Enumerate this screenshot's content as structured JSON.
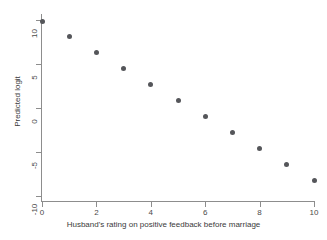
{
  "chart_data": {
    "type": "scatter",
    "title": "",
    "subtitle": "",
    "xlabel": "Husband's rating on positive feedback before marriage",
    "ylabel": "Predicted logit",
    "xlim": [
      0,
      10
    ],
    "ylim": [
      -10,
      10
    ],
    "xticks": [
      0,
      2,
      4,
      6,
      8,
      10
    ],
    "xtick_labels": [
      "0",
      "2",
      "4",
      "6",
      "8",
      "10"
    ],
    "yticks": [
      10,
      5,
      0,
      -5,
      -10
    ],
    "ytick_labels": [
      "10",
      "5",
      "0",
      "-5",
      "-10"
    ],
    "grid": false,
    "legend": null,
    "marker_color": "#55565a",
    "axis_color": "#8d8d8d",
    "background": "#ffffff",
    "x": [
      0,
      1,
      2,
      3,
      4,
      5,
      6,
      7,
      8,
      9,
      10
    ],
    "values": [
      9.8,
      8.1,
      6.3,
      4.5,
      2.7,
      0.8,
      -1.0,
      -2.8,
      -4.6,
      -6.4,
      -8.2
    ],
    "series": [
      {
        "name": "Predicted logit",
        "x": [
          0,
          1,
          2,
          3,
          4,
          5,
          6,
          7,
          8,
          9,
          10
        ],
        "values": [
          9.8,
          8.1,
          6.3,
          4.5,
          2.7,
          0.8,
          -1.0,
          -2.8,
          -4.6,
          -6.4,
          -8.2
        ]
      }
    ]
  }
}
